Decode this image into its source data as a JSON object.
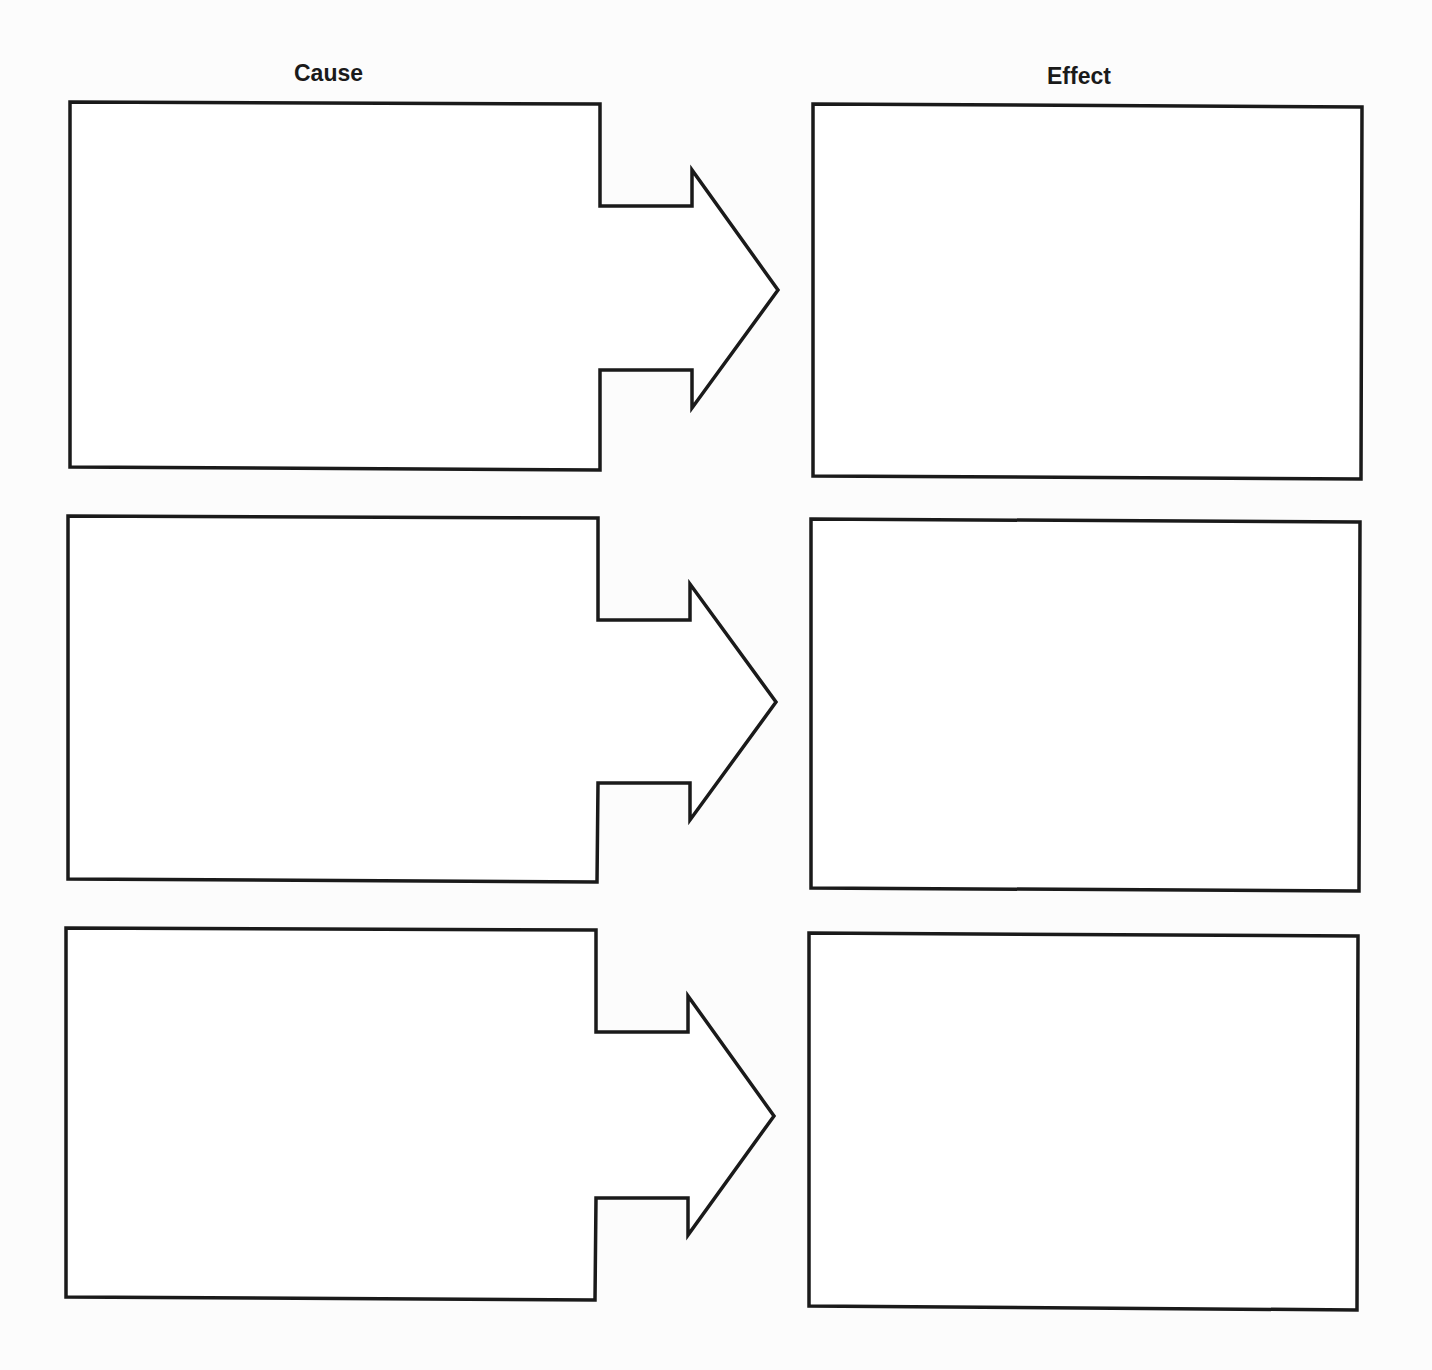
{
  "headers": {
    "cause": "Cause",
    "effect": "Effect"
  },
  "diagram": {
    "type": "cause-effect organizer",
    "rows": 3,
    "stroke_color": "#1a1a1a",
    "background": "#fcfcfc",
    "cause_boxes": [
      {
        "row": 1,
        "content": ""
      },
      {
        "row": 2,
        "content": ""
      },
      {
        "row": 3,
        "content": ""
      }
    ],
    "effect_boxes": [
      {
        "row": 1,
        "content": ""
      },
      {
        "row": 2,
        "content": ""
      },
      {
        "row": 3,
        "content": ""
      }
    ]
  }
}
